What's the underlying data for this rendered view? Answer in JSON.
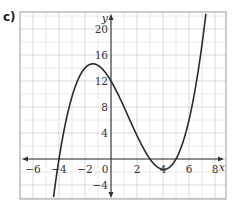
{
  "figure_label": "c)",
  "chart_data": {
    "type": "line",
    "title": "",
    "xlabel": "x",
    "ylabel": "y",
    "xlim": [
      -7,
      8.5
    ],
    "ylim": [
      -6,
      22.5
    ],
    "grid": true,
    "x_ticks": [
      -6,
      -4,
      -2,
      0,
      2,
      4,
      6,
      8
    ],
    "y_ticks": [
      -4,
      4,
      8,
      12,
      16,
      20
    ],
    "x_tick_labels": [
      "−6",
      "−4",
      "−2",
      "0",
      "2",
      "4",
      "6",
      "8"
    ],
    "y_tick_labels": [
      "−4",
      "4",
      "8",
      "12",
      "16",
      "20"
    ],
    "series": [
      {
        "name": "cubic curve",
        "description": "y = (x+4)(x-3)(x-5)/5 (approx. fit): roots near x=-4, 3, 5; local max ≈ 14.6 near x≈-1.4; local min ≈ -1.6 near x≈4; y-intercept 12",
        "x": [
          -4.4,
          -4,
          -3,
          -2,
          -1,
          0,
          1,
          2,
          3,
          4,
          5,
          6,
          7,
          7.3
        ],
        "y": [
          -6.0,
          0,
          9.6,
          14.0,
          14.4,
          12.0,
          8.0,
          3.6,
          0,
          -1.6,
          0,
          6.0,
          17.6,
          22.4
        ]
      }
    ],
    "roots": [
      -4,
      3,
      5
    ],
    "local_max": {
      "x": -1.4,
      "y": 14.6
    },
    "local_min": {
      "x": 4.1,
      "y": -1.6
    },
    "y_intercept": 12
  }
}
